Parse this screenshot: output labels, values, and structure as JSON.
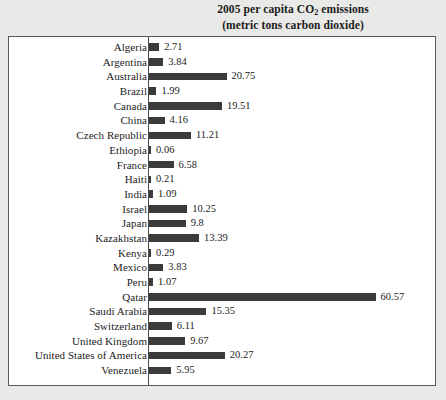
{
  "chart_data": {
    "type": "bar",
    "orientation": "horizontal",
    "title": "2005 per capita CO2 emissions",
    "subtitle": "(metric tons carbon dioxide)",
    "title_line1_prefix": "2005 per capita CO",
    "title_line1_sub": "2",
    "title_line1_suffix": " emissions",
    "title_line2": "(metric tons carbon dioxide)",
    "xlabel": "",
    "ylabel": "",
    "grid": false,
    "legend": "none",
    "xlim": [
      0,
      60.57
    ],
    "bar_color": "#3b3b3b",
    "categories": [
      "Algeria",
      "Argentina",
      "Australia",
      "Brazil",
      "Canada",
      "China",
      "Czech Republic",
      "Ethiopia",
      "France",
      "Haiti",
      "India",
      "Israel",
      "Japan",
      "Kazakhstan",
      "Kenya",
      "Mexico",
      "Peru",
      "Qatar",
      "Saudi Arabia",
      "Switzerland",
      "United Kingdom",
      "United States of America",
      "Venezuela"
    ],
    "values": [
      2.71,
      3.84,
      20.75,
      1.99,
      19.51,
      4.16,
      11.21,
      0.06,
      6.58,
      0.21,
      1.09,
      10.25,
      9.8,
      13.39,
      0.29,
      3.83,
      1.07,
      60.57,
      15.35,
      6.11,
      9.67,
      20.27,
      5.95
    ],
    "value_labels": [
      "2.71",
      "3.84",
      "20.75",
      "1.99",
      "19.51",
      "4.16",
      "11.21",
      "0.06",
      "6.58",
      "0.21",
      "1.09",
      "10.25",
      "9.8",
      "13.39",
      "0.29",
      "3.83",
      "1.07",
      "60.57",
      "15.35",
      "6.11",
      "9.67",
      "20.27",
      "5.95"
    ]
  }
}
